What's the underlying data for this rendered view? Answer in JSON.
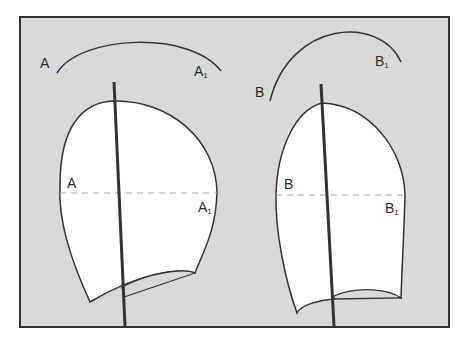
{
  "diagram": {
    "colors": {
      "background": "#d9d9d9",
      "frame": "#333333",
      "piece_fill": "#ffffff",
      "outline": "#333333",
      "dashed_line": "#aaaaaa"
    },
    "left_piece": {
      "arc_label_start": "A",
      "arc_label_end": "A",
      "arc_label_end_sub": "1",
      "line_label_start": "A",
      "line_label_end": "A",
      "line_label_end_sub": "1"
    },
    "right_piece": {
      "arc_label_start": "B",
      "arc_label_end": "B",
      "arc_label_end_sub": "1",
      "line_label_start": "B",
      "line_label_end": "B",
      "line_label_end_sub": "1"
    }
  }
}
